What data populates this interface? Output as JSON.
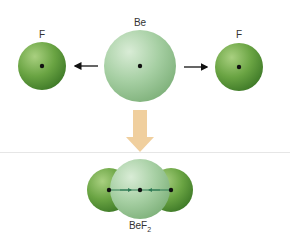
{
  "diagram": {
    "atoms": {
      "be": {
        "label": "Be"
      },
      "f_left": {
        "label": "F"
      },
      "f_right": {
        "label": "F"
      }
    },
    "product": {
      "label_main": "BeF",
      "label_sub": "2"
    },
    "colors": {
      "f_green": "#5f9a3a",
      "be_green": "#9cc79a",
      "arrow_down": "#f0cf9e",
      "divider": "#e6e6e6"
    }
  }
}
